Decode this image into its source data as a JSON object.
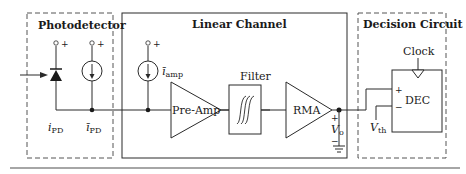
{
  "diagram": {
    "sections": {
      "photodetector": {
        "title": "Photodetector"
      },
      "linear_channel": {
        "title": "Linear Channel"
      },
      "decision_circuit": {
        "title": "Decision Circuit"
      }
    },
    "components": {
      "photodiode_current": {
        "symbol": "i",
        "subscript": "PD"
      },
      "pd_noise_source": {
        "symbol": "ī",
        "subscript": "PD"
      },
      "amp_noise_source": {
        "symbol": "ī",
        "subscript": "amp"
      },
      "preamp": {
        "label": "Pre-Amp"
      },
      "filter": {
        "label": "Filter"
      },
      "rma": {
        "label": "RMA"
      },
      "output_voltage": {
        "symbol": "V",
        "subscript": "o"
      },
      "decision": {
        "label": "DEC",
        "clock_label": "Clock"
      },
      "threshold": {
        "symbol": "V",
        "subscript": "th"
      }
    },
    "signs": {
      "plus": "+",
      "minus": "−"
    },
    "colors": {
      "line": "#2a2a2a",
      "dashed": "#555555",
      "rule": "#888888"
    }
  }
}
